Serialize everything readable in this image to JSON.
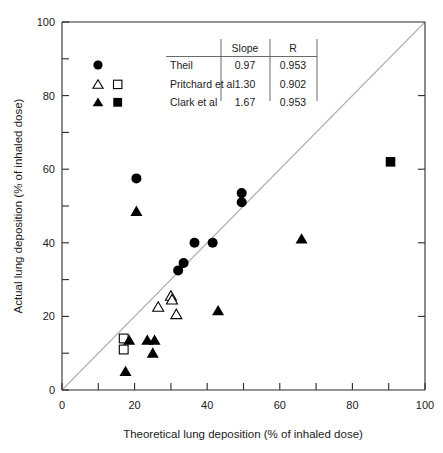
{
  "chart_data": {
    "type": "scatter",
    "title": "",
    "xlabel": "Theoretical lung deposition  (% of inhaled dose)",
    "ylabel": "Actual lung deposition  (% of inhaled dose)",
    "xlim": [
      0,
      100
    ],
    "ylim": [
      0,
      100
    ],
    "xticks": [
      0,
      10,
      20,
      30,
      40,
      50,
      60,
      70,
      80,
      90,
      100
    ],
    "yticks": [
      0,
      10,
      20,
      30,
      40,
      50,
      60,
      70,
      80,
      90,
      100
    ],
    "xtick_labels": [
      "0",
      "",
      "20",
      "",
      "40",
      "",
      "60",
      "",
      "80",
      "",
      "100"
    ],
    "ytick_labels": [
      "0",
      "",
      "20",
      "",
      "40",
      "",
      "60",
      "",
      "80",
      "",
      "100"
    ],
    "grid": false,
    "legend_position": "top-left-inside",
    "reference_line": {
      "name": "identity-line",
      "from": [
        0,
        0
      ],
      "to": [
        100,
        100
      ],
      "color": "#b0b0b0"
    },
    "series": [
      {
        "name": "Theil",
        "marker": "filled-circle",
        "color": "#000000",
        "slope": "0.97",
        "r": "0.953",
        "points": [
          [
            20.5,
            57.5
          ],
          [
            32.0,
            32.5
          ],
          [
            33.5,
            34.5
          ],
          [
            36.5,
            40.0
          ],
          [
            41.5,
            40.0
          ],
          [
            49.5,
            53.5
          ],
          [
            49.5,
            51.0
          ]
        ]
      },
      {
        "name": "Pritchard et al",
        "marker": "open-triangle",
        "color": "#000000",
        "slope": "1.30",
        "r": "0.902",
        "points": [
          [
            30.0,
            25.5
          ],
          [
            30.3,
            24.5
          ],
          [
            26.5,
            22.5
          ],
          [
            31.5,
            20.5
          ]
        ]
      },
      {
        "name": "Pritchard et al",
        "marker": "open-square",
        "color": "#000000",
        "slope": "1.30",
        "r": "0.902",
        "points": [
          [
            17.0,
            14.0
          ],
          [
            17.0,
            11.0
          ]
        ]
      },
      {
        "name": "Clark et al",
        "marker": "filled-triangle",
        "color": "#000000",
        "slope": "1.67",
        "r": "0.953",
        "points": [
          [
            20.5,
            48.5
          ],
          [
            66.0,
            41.0
          ],
          [
            43.0,
            21.5
          ],
          [
            18.5,
            13.5
          ],
          [
            23.5,
            13.5
          ],
          [
            25.5,
            13.5
          ],
          [
            25.0,
            10.0
          ],
          [
            17.5,
            5.0
          ]
        ]
      },
      {
        "name": "Clark et al",
        "marker": "filled-square",
        "color": "#000000",
        "slope": "1.67",
        "r": "0.953",
        "points": [
          [
            90.5,
            62.0
          ]
        ]
      }
    ]
  },
  "legend": {
    "columns": [
      "",
      "Slope",
      "R"
    ],
    "header_slope": "Slope",
    "header_r": "R",
    "rows": [
      {
        "markers": [
          "filled-circle"
        ],
        "label": "Theil",
        "slope": "0.97",
        "r": "0.953"
      },
      {
        "markers": [
          "open-triangle",
          "open-square"
        ],
        "label": "Pritchard et al",
        "slope": "1.30",
        "r": "0.902"
      },
      {
        "markers": [
          "filled-triangle",
          "filled-square"
        ],
        "label": "Clark et al",
        "slope": "1.67",
        "r": "0.953"
      }
    ]
  },
  "axes": {
    "y_title": "Actual lung deposition  (% of inhaled dose)",
    "x_title": "Theoretical lung deposition  (% of inhaled dose)",
    "x_labels": [
      "0",
      "20",
      "40",
      "60",
      "80",
      "100"
    ],
    "y_labels": [
      "0",
      "20",
      "40",
      "60",
      "80",
      "100"
    ]
  }
}
